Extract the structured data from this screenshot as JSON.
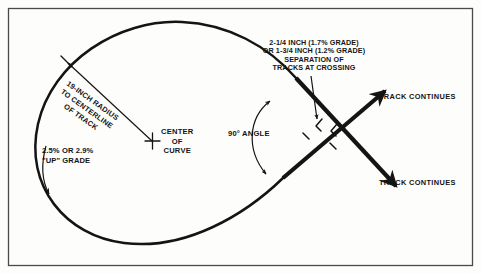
{
  "figure": {
    "kind": "technical-line-diagram",
    "background_color": "#fdfdfc",
    "ink_color": "#141414",
    "border_color": "#4a4a4a"
  },
  "labels": {
    "separation_callout": "2-1/4 INCH (1.7% GRADE)\nOR 1-3/4 INCH (1.2% GRADE)\nSEPARATION OF\nTRACKS AT CROSSING",
    "radius_callout": "19-INCH RADIUS\nTO CENTERLINE\nOF TRACK",
    "center_of_curve": "CENTER\nOF\nCURVE",
    "grade_callout": "2.5% OR 2.9%\n\"UP\" GRADE",
    "angle_callout": "90° ANGLE",
    "track_continues_upper": "TRACK CONTINUES",
    "track_continues_lower": "TRACK CONTINUES"
  },
  "values": {
    "radius_inches": "19",
    "separation_primary_inches": "2-1/4",
    "separation_primary_grade_percent": "1.7",
    "separation_alternate_inches": "1-3/4",
    "separation_alternate_grade_percent": "1.2",
    "up_grade_primary_percent": "2.5",
    "up_grade_alternate_percent": "2.9",
    "crossing_angle_degrees": "90"
  },
  "marks": {
    "center_cross": "plus-tick-mark",
    "radius_arrow": "single-headed-arrow",
    "grade_arrow": "curved-arrow-down",
    "angle_arc": "double-headed-curved-arc",
    "separation_leader": "vertical-leader-arrow",
    "track_end_upper": "arrowhead-northeast",
    "track_end_lower": "arrowhead-southeast",
    "separation_brackets": "offset-bracket-pair"
  }
}
